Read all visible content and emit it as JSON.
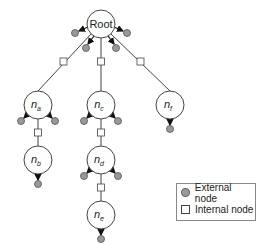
{
  "nodes": {
    "root": {
      "label": "Root"
    },
    "na": {
      "base": "n",
      "sub": "a"
    },
    "nb": {
      "base": "n",
      "sub": "b"
    },
    "nc": {
      "base": "n",
      "sub": "c"
    },
    "nd": {
      "base": "n",
      "sub": "d"
    },
    "ne": {
      "base": "n",
      "sub": "e"
    },
    "nf": {
      "base": "n",
      "sub": "f"
    }
  },
  "legend": {
    "external": "External node",
    "internal": "Internal node"
  },
  "colors": {
    "external_fill": "#999999",
    "stroke": "#444444"
  }
}
